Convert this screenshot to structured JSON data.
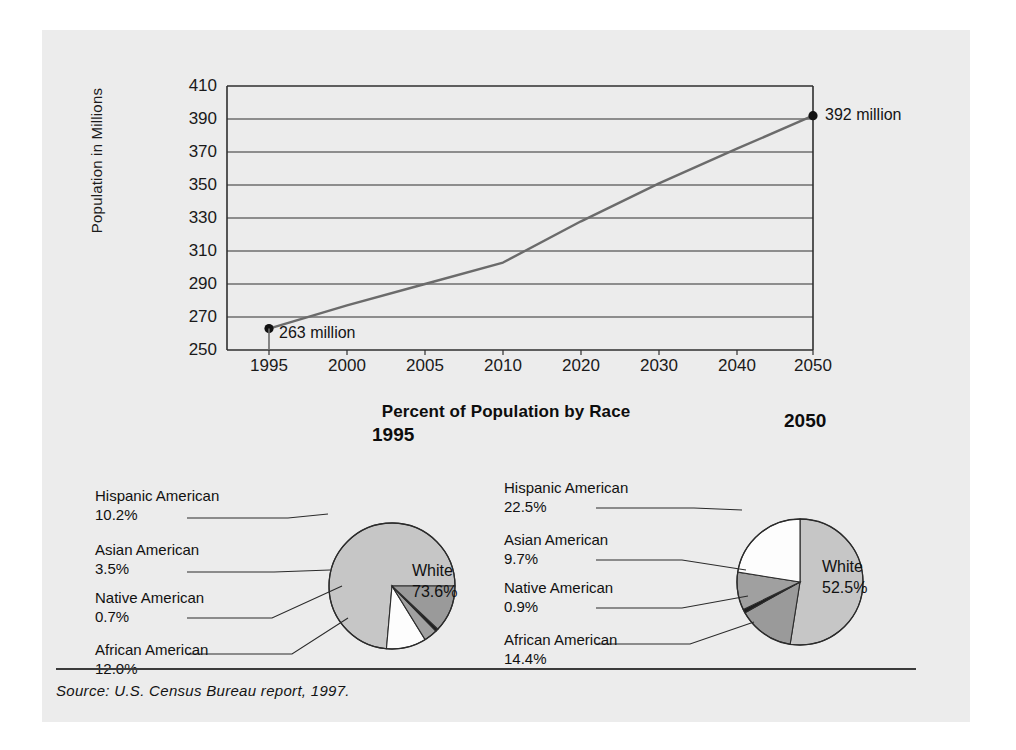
{
  "figure": {
    "source_note": "Source: U.S. Census Bureau report, 1997.",
    "background_color": "#ececec"
  },
  "line_chart": {
    "ylabel": "Population in Millions",
    "yticks": [
      "410",
      "390",
      "370",
      "350",
      "330",
      "310",
      "290",
      "270",
      "250"
    ],
    "xticks": [
      "1995",
      "2000",
      "2005",
      "2010",
      "2020",
      "2030",
      "2040",
      "2050"
    ],
    "start_annotation": "263 million",
    "end_annotation": "392 million"
  },
  "pie_section": {
    "title": "Percent of Population by Race",
    "pies": [
      {
        "year": "1995",
        "center_label_name": "White",
        "center_label_value": "73.6%",
        "labels": [
          {
            "name": "Hispanic American",
            "value": "10.2%"
          },
          {
            "name": "Asian American",
            "value": "3.5%"
          },
          {
            "name": "Native American",
            "value": "0.7%"
          },
          {
            "name": "African American",
            "value": "12.0%"
          }
        ]
      },
      {
        "year": "2050",
        "center_label_name": "White",
        "center_label_value": "52.5%",
        "labels": [
          {
            "name": "Hispanic American",
            "value": "22.5%"
          },
          {
            "name": "Asian American",
            "value": "9.7%"
          },
          {
            "name": "Native American",
            "value": "0.9%"
          },
          {
            "name": "African American",
            "value": "14.4%"
          }
        ]
      }
    ]
  },
  "chart_data": [
    {
      "type": "line",
      "title": "",
      "xlabel": "",
      "ylabel": "Population in Millions",
      "x": [
        "1995",
        "2000",
        "2005",
        "2010",
        "2020",
        "2030",
        "2040",
        "2050"
      ],
      "tick_positions_px": [
        227,
        305,
        383,
        461,
        539,
        617,
        695,
        771
      ],
      "values": [
        263,
        277,
        290,
        303,
        328,
        351,
        372,
        392
      ],
      "ylim": [
        250,
        410
      ],
      "ytick_step": 20,
      "grid": true,
      "legend": "none",
      "annotations": [
        {
          "point": "1995",
          "text": "263 million",
          "value": 263
        },
        {
          "point": "2050",
          "text": "392 million",
          "value": 392
        }
      ]
    },
    {
      "type": "pie",
      "title": "1995",
      "suptitle": "Percent of Population by Race",
      "categories": [
        "White",
        "Hispanic American",
        "Asian American",
        "Native American",
        "African American"
      ],
      "values": [
        73.6,
        10.2,
        3.5,
        0.7,
        12.0
      ],
      "colors": [
        "#c6c6c6",
        "#fdfdfd",
        "#a0a0a0",
        "#1e1e1e",
        "#9a9a9a"
      ],
      "start_angle_deg": 0,
      "direction": "counterclockwise",
      "legend": "leader-labels-left"
    },
    {
      "type": "pie",
      "title": "2050",
      "suptitle": "Percent of Population by Race",
      "categories": [
        "White",
        "African American",
        "Native American",
        "Asian American",
        "Hispanic American"
      ],
      "values": [
        52.5,
        14.4,
        0.9,
        9.7,
        22.5
      ],
      "colors": [
        "#c6c6c6",
        "#9a9a9a",
        "#1e1e1e",
        "#a0a0a0",
        "#fdfdfd"
      ],
      "start_angle_deg": 90,
      "direction": "clockwise",
      "legend": "leader-labels-left"
    }
  ]
}
